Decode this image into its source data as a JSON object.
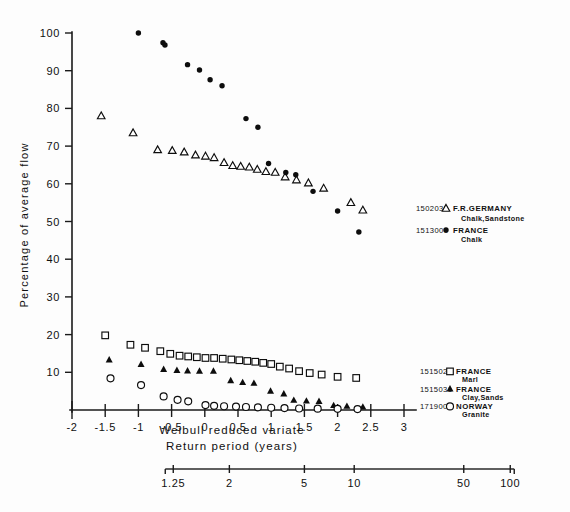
{
  "chart_data": {
    "type": "scatter",
    "title": "",
    "xlabel": "Weibull reduced variate",
    "xlabel2": "Return period (years)",
    "ylabel": "Percentage of average flow",
    "xlim": [
      -2,
      3
    ],
    "ylim": [
      0,
      100
    ],
    "grid": false,
    "legend_position": "right",
    "x_ticks": [
      "-2",
      "-1.5",
      "-1",
      "-0.5",
      "0",
      "0.5",
      "1",
      "1.5",
      "2",
      "2.5",
      "3"
    ],
    "x_tick_values": [
      -2,
      -1.5,
      -1,
      -0.5,
      0,
      0.5,
      1,
      1.5,
      2,
      2.5,
      3
    ],
    "y_ticks": [
      "10",
      "20",
      "30",
      "40",
      "50",
      "60",
      "70",
      "80",
      "90",
      "100"
    ],
    "y_tick_values": [
      10,
      20,
      30,
      40,
      50,
      60,
      70,
      80,
      90,
      100
    ],
    "return_period_ticks": [
      "1.25",
      "2",
      "5",
      "10",
      "50",
      "100"
    ],
    "return_period_tick_values": [
      1.25,
      2,
      5,
      10,
      50,
      100
    ],
    "return_period_tick_x": [
      -0.475,
      0.37,
      1.5,
      2.25,
      3.9,
      4.6
    ],
    "series": [
      {
        "name": "F.R.GERMANY",
        "station": "1502035",
        "geology": "Chalk,Sandstone",
        "marker": "open-triangle",
        "color": "#0d0d0d",
        "points": [
          [
            -1.56,
            78.0
          ],
          [
            -1.08,
            73.5
          ],
          [
            -0.71,
            69.0
          ],
          [
            -0.49,
            68.8
          ],
          [
            -0.31,
            68.4
          ],
          [
            -0.14,
            67.6
          ],
          [
            0.01,
            67.3
          ],
          [
            0.14,
            66.9
          ],
          [
            0.29,
            65.6
          ],
          [
            0.42,
            64.8
          ],
          [
            0.54,
            64.6
          ],
          [
            0.67,
            64.4
          ],
          [
            0.79,
            63.8
          ],
          [
            0.92,
            63.2
          ],
          [
            1.06,
            63.0
          ],
          [
            1.21,
            61.8
          ],
          [
            1.38,
            61.0
          ],
          [
            1.56,
            60.2
          ],
          [
            1.79,
            58.8
          ],
          [
            2.2,
            55.0
          ],
          [
            2.38,
            53.0
          ]
        ]
      },
      {
        "name": "FRANCE",
        "station": "1513006",
        "geology": "Chalk",
        "marker": "filled-circle",
        "color": "#0d0d0d",
        "points": [
          [
            -1.0,
            100.0
          ],
          [
            -0.63,
            97.4
          ],
          [
            -0.6,
            96.8
          ],
          [
            -0.26,
            91.6
          ],
          [
            -0.08,
            90.2
          ],
          [
            0.08,
            87.6
          ],
          [
            0.26,
            86.0
          ],
          [
            0.62,
            77.3
          ],
          [
            0.8,
            75.0
          ],
          [
            0.96,
            65.4
          ],
          [
            1.22,
            63.0
          ],
          [
            1.37,
            62.4
          ],
          [
            1.63,
            58.0
          ],
          [
            2.0,
            52.8
          ],
          [
            2.32,
            47.2
          ]
        ]
      },
      {
        "name": "FRANCE",
        "station": "1515024",
        "geology": "Marl",
        "marker": "open-square",
        "color": "#0d0d0d",
        "points": [
          [
            -1.5,
            19.8
          ],
          [
            -1.12,
            17.3
          ],
          [
            -0.9,
            16.5
          ],
          [
            -0.67,
            15.6
          ],
          [
            -0.52,
            14.9
          ],
          [
            -0.38,
            14.4
          ],
          [
            -0.25,
            14.2
          ],
          [
            -0.12,
            14.0
          ],
          [
            0.01,
            13.8
          ],
          [
            0.14,
            13.8
          ],
          [
            0.27,
            13.6
          ],
          [
            0.4,
            13.4
          ],
          [
            0.52,
            13.2
          ],
          [
            0.64,
            13.0
          ],
          [
            0.76,
            12.8
          ],
          [
            0.88,
            12.5
          ],
          [
            1.0,
            12.2
          ],
          [
            1.13,
            11.5
          ],
          [
            1.27,
            11.0
          ],
          [
            1.42,
            10.3
          ],
          [
            1.58,
            9.8
          ],
          [
            1.76,
            9.4
          ],
          [
            2.0,
            8.8
          ],
          [
            2.28,
            8.5
          ]
        ]
      },
      {
        "name": "FRANCE",
        "station": "1515031",
        "geology": "Clay,Sands",
        "marker": "filled-triangle",
        "color": "#0d0d0d",
        "points": [
          [
            -1.44,
            13.3
          ],
          [
            -0.96,
            12.1
          ],
          [
            -0.62,
            10.8
          ],
          [
            -0.42,
            10.5
          ],
          [
            -0.26,
            10.4
          ],
          [
            -0.08,
            10.3
          ],
          [
            0.13,
            10.3
          ],
          [
            0.39,
            7.8
          ],
          [
            0.57,
            7.3
          ],
          [
            0.74,
            7.1
          ],
          [
            0.99,
            5.0
          ],
          [
            1.19,
            4.3
          ],
          [
            1.34,
            2.6
          ],
          [
            1.53,
            2.4
          ],
          [
            1.72,
            2.3
          ],
          [
            1.94,
            1.2
          ],
          [
            2.14,
            1.0
          ],
          [
            2.38,
            0.8
          ]
        ]
      },
      {
        "name": "NORWAY",
        "station": "1719005",
        "geology": "Granite",
        "marker": "open-circle",
        "color": "#0d0d0d",
        "points": [
          [
            -1.42,
            8.4
          ],
          [
            -0.96,
            6.6
          ],
          [
            -0.62,
            3.6
          ],
          [
            -0.41,
            2.7
          ],
          [
            -0.25,
            2.3
          ],
          [
            0.01,
            1.3
          ],
          [
            0.14,
            1.1
          ],
          [
            0.29,
            1.0
          ],
          [
            0.47,
            0.9
          ],
          [
            0.62,
            0.8
          ],
          [
            0.8,
            0.7
          ],
          [
            1.0,
            0.6
          ],
          [
            1.2,
            0.5
          ],
          [
            1.42,
            0.4
          ],
          [
            1.7,
            0.35
          ],
          [
            2.0,
            0.3
          ],
          [
            2.3,
            0.25
          ]
        ]
      }
    ]
  },
  "legend_top": {
    "entries": [
      {
        "station": "1502035",
        "marker": "open-triangle",
        "country": "F.R.GERMANY",
        "geology": "Chalk,Sandstone"
      },
      {
        "station": "1513006",
        "marker": "filled-circle",
        "country": "FRANCE",
        "geology": "Chalk"
      }
    ]
  },
  "legend_bottom": {
    "entries": [
      {
        "station": "1515024",
        "marker": "open-square",
        "country": "FRANCE",
        "geology": "Marl"
      },
      {
        "station": "1515031",
        "marker": "filled-triangle",
        "country": "FRANCE",
        "geology": "Clay,Sands"
      },
      {
        "station": "1719005",
        "marker": "open-circle",
        "country": "NORWAY",
        "geology": "Granite"
      }
    ]
  }
}
